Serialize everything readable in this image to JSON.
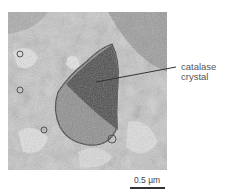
{
  "figure": {
    "type": "electron micrograph",
    "label": {
      "line1": "catalase",
      "line2": "crystal"
    },
    "scale_bar": {
      "text": "0.5 µm"
    }
  }
}
